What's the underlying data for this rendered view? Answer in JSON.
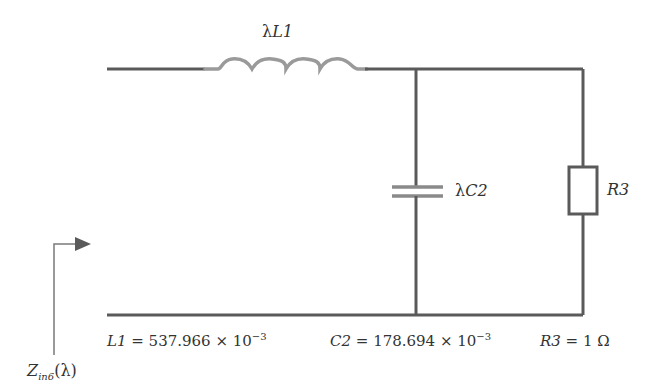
{
  "diagram": {
    "type": "circuit-schematic",
    "colors": {
      "wire": "#5a5a5a",
      "inductor": "#9a9a9a",
      "capacitor": "#8a8a8a",
      "text": "#333333",
      "background": "#ffffff"
    },
    "components": {
      "inductor": {
        "label_prefix": "λ",
        "label_name": "L1"
      },
      "capacitor": {
        "label_prefix": "λ",
        "label_name": "C2"
      },
      "resistor": {
        "label_name": "R3"
      }
    },
    "input_label": {
      "symbol": "Z",
      "subscript": "in6",
      "argument": "(λ)"
    },
    "values": {
      "L1": {
        "name": "L1",
        "equals": " = 537.966 × 10",
        "exponent": "−3"
      },
      "C2": {
        "name": "C2",
        "equals": " = 178.694 × 10",
        "exponent": "−3"
      },
      "R3": {
        "name": "R3",
        "equals": " = 1 Ω"
      }
    }
  }
}
